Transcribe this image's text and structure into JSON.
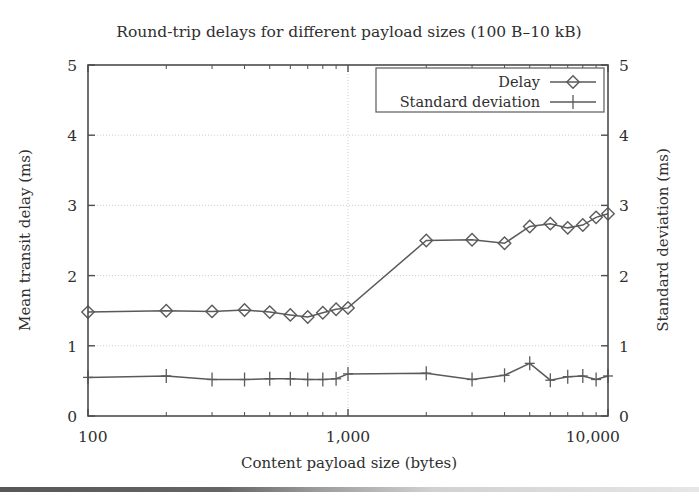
{
  "figure": {
    "title": "Round-trip delays for different payload sizes (100 B–10 kB)",
    "background_color": "#ffffff",
    "frame_color": "#4d4d4d",
    "grid_color": "#c8c8c8",
    "series_color": "#5a5a5a"
  },
  "chart_data": {
    "type": "line",
    "title": "Round-trip delays for different payload sizes (100 B–10 kB)",
    "xlabel": "Content payload size (bytes)",
    "ylabel": "Mean transit delay (ms)",
    "y2label": "Standard deviation (ms)",
    "xscale": "log",
    "xlim": [
      100,
      10000
    ],
    "ylim": [
      0,
      5
    ],
    "y2lim": [
      0,
      5
    ],
    "grid": true,
    "legend_position": "top-right",
    "xticks": [
      100,
      1000,
      10000
    ],
    "xticklabels": [
      "100",
      "1,000",
      "10,000"
    ],
    "yticks": [
      0,
      1,
      2,
      3,
      4,
      5
    ],
    "yticklabels": [
      "0",
      "1",
      "2",
      "3",
      "4",
      "5"
    ],
    "y2ticks": [
      0,
      1,
      2,
      3,
      4,
      5
    ],
    "y2ticklabels": [
      "0",
      "1",
      "2",
      "3",
      "4",
      "5"
    ],
    "x": [
      100,
      200,
      300,
      400,
      500,
      600,
      700,
      800,
      900,
      1000,
      2000,
      3000,
      4000,
      5000,
      6000,
      7000,
      8000,
      9000,
      10000
    ],
    "series": [
      {
        "name": "Delay",
        "marker": "diamond",
        "values": [
          1.48,
          1.5,
          1.49,
          1.51,
          1.48,
          1.44,
          1.41,
          1.47,
          1.52,
          1.54,
          2.5,
          2.51,
          2.46,
          2.7,
          2.74,
          2.68,
          2.72,
          2.83,
          2.88
        ]
      },
      {
        "name": "Standard deviation",
        "marker": "plus",
        "values": [
          0.55,
          0.57,
          0.52,
          0.52,
          0.53,
          0.53,
          0.52,
          0.52,
          0.53,
          0.6,
          0.61,
          0.52,
          0.58,
          0.75,
          0.51,
          0.56,
          0.57,
          0.52,
          0.57
        ]
      }
    ]
  },
  "legend": {
    "items": [
      {
        "label": "Delay",
        "marker": "diamond"
      },
      {
        "label": "Standard deviation",
        "marker": "plus"
      }
    ]
  },
  "axes": {
    "left_title": "Mean transit delay (ms)",
    "right_title": "Standard deviation (ms)",
    "bottom_title": "Content payload size (bytes)",
    "y_tick_0": "0",
    "y_tick_1": "1",
    "y_tick_2": "2",
    "y_tick_3": "3",
    "y_tick_4": "4",
    "y_tick_5": "5",
    "y2_tick_0": "0",
    "y2_tick_1": "1",
    "y2_tick_2": "2",
    "y2_tick_3": "3",
    "y2_tick_4": "4",
    "y2_tick_5": "5",
    "x_tick_100": "100",
    "x_tick_1000": "1,000",
    "x_tick_10000": "10,000"
  }
}
